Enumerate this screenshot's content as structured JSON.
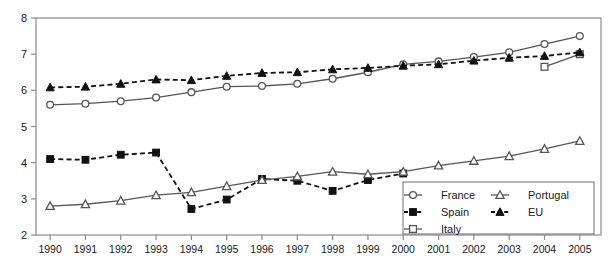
{
  "chart_data": {
    "type": "line",
    "title": "",
    "xlabel": "",
    "ylabel": "",
    "x": [
      1990,
      1991,
      1992,
      1993,
      1994,
      1995,
      1996,
      1997,
      1998,
      1999,
      2000,
      2001,
      2002,
      2003,
      2004,
      2005
    ],
    "xlim": [
      1989.6,
      2005.6
    ],
    "ylim": [
      2,
      8
    ],
    "yticks": [
      2,
      3,
      4,
      5,
      6,
      7,
      8
    ],
    "xticks": [
      "1990",
      "1991",
      "1992",
      "1993",
      "1994",
      "1995",
      "1996",
      "1997",
      "1998",
      "1999",
      "2000",
      "2001",
      "2002",
      "2003",
      "2004",
      "2005"
    ],
    "grid": false,
    "legend_position": "bottom-right",
    "series": [
      {
        "name": "France",
        "marker": "circle-open",
        "line": "solid",
        "color": "#555555",
        "values": [
          5.6,
          5.63,
          5.7,
          5.8,
          5.95,
          6.1,
          6.12,
          6.18,
          6.32,
          6.5,
          6.72,
          6.8,
          6.92,
          7.05,
          7.28,
          7.5
        ]
      },
      {
        "name": "Spain",
        "marker": "square-filled",
        "line": "dashed",
        "color": "#111111",
        "values": [
          4.1,
          4.08,
          4.22,
          4.28,
          2.72,
          2.98,
          3.55,
          3.5,
          3.22,
          3.52,
          3.7,
          null,
          null,
          null,
          null,
          null
        ]
      },
      {
        "name": "Italy",
        "marker": "square-open",
        "line": "solid",
        "color": "#555555",
        "values": [
          null,
          null,
          null,
          null,
          null,
          null,
          null,
          null,
          null,
          null,
          null,
          null,
          null,
          null,
          6.65,
          7.0
        ]
      },
      {
        "name": "Portugal",
        "marker": "triangle-open",
        "line": "solid",
        "color": "#555555",
        "values": [
          2.8,
          2.85,
          2.95,
          3.1,
          3.18,
          3.35,
          3.52,
          3.62,
          3.75,
          3.68,
          3.75,
          3.92,
          4.05,
          4.18,
          4.38,
          4.6
        ]
      },
      {
        "name": "EU",
        "marker": "triangle-filled",
        "line": "dashed",
        "color": "#111111",
        "values": [
          6.08,
          6.1,
          6.18,
          6.3,
          6.28,
          6.4,
          6.48,
          6.5,
          6.58,
          6.62,
          6.68,
          6.72,
          6.82,
          6.9,
          6.95,
          7.05
        ]
      }
    ]
  }
}
